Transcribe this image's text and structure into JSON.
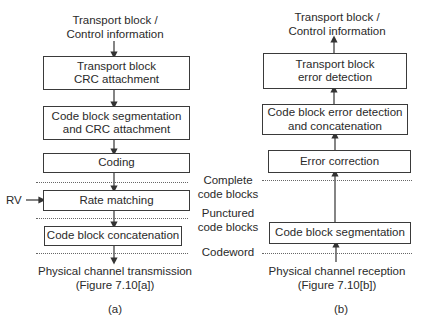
{
  "left": {
    "top_label": [
      "Transport block /",
      "Control information"
    ],
    "boxes": [
      [
        "Transport block",
        "CRC attachment"
      ],
      [
        "Code block segmentation",
        "and CRC attachment"
      ],
      [
        "Coding"
      ],
      [
        "Rate matching"
      ],
      [
        "Code block concatenation"
      ]
    ],
    "rv_label": "RV",
    "bottom_label": [
      "Physical channel transmission",
      "(Figure 7.10[a])"
    ],
    "caption": "(a)"
  },
  "right": {
    "top_label": [
      "Transport block /",
      "Control information"
    ],
    "boxes": [
      [
        "Transport block",
        "error detection"
      ],
      [
        "Code block error detection",
        "and concatenation"
      ],
      [
        "Error correction"
      ],
      [
        "Code block segmentation"
      ]
    ],
    "bottom_label": [
      "Physical channel reception",
      "(Figure 7.10[b])"
    ],
    "caption": "(b)"
  },
  "middle_labels": {
    "complete": [
      "Complete",
      "code blocks"
    ],
    "punctured": [
      "Punctured",
      "code blocks"
    ],
    "codeword": "Codeword"
  }
}
